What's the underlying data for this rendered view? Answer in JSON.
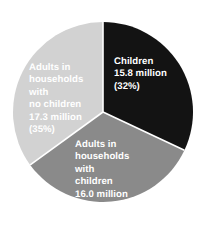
{
  "chart_data": {
    "type": "pie",
    "title": "",
    "subtitle": "",
    "xlabel": "",
    "ylabel": "",
    "legend_position": "none",
    "grid": false,
    "units": "million",
    "start_angle_deg": 0,
    "direction": "clockwise",
    "categories": [
      "Children",
      "Adults in households with children",
      "Adults in households with no children"
    ],
    "values": [
      15.8,
      16.0,
      17.3
    ],
    "percentages": [
      32,
      33,
      35
    ],
    "colors": [
      "#131313",
      "#8a8a8a",
      "#d2d2d2"
    ],
    "slices": [
      {
        "name": "Children",
        "label_lines": "Children\n15.8 million\n(32%)",
        "value": 15.8,
        "percent": 32,
        "color": "#131313",
        "label_color": "#ffffff"
      },
      {
        "name": "Adults in households with children",
        "label_lines": "Adults in\nhouseholds with\nchildren\n16.0 million\n(33%)",
        "value": 16.0,
        "percent": 33,
        "color": "#8a8a8a",
        "label_color": "#ffffff"
      },
      {
        "name": "Adults in households with no children",
        "label_lines": "Adults in\nhouseholds with\nno children\n17.3 million\n(35%)",
        "value": 17.3,
        "percent": 35,
        "color": "#d2d2d2",
        "label_color": "#ffffff"
      }
    ]
  },
  "figure": {
    "background": "#ffffff",
    "separator_color": "#ffffff"
  }
}
